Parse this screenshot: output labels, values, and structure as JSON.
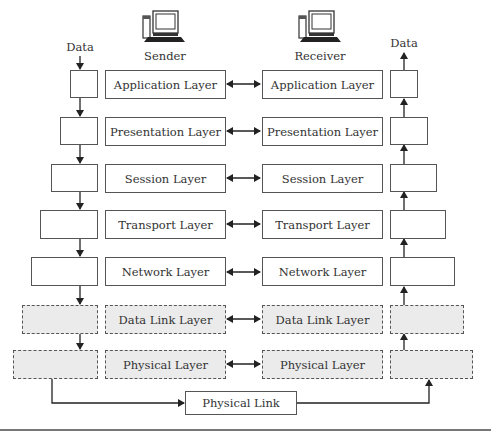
{
  "diagram": {
    "sender_label": "Sender",
    "receiver_label": "Receiver",
    "data_in_label": "Data",
    "data_out_label": "Data",
    "sender_icon": "computer-icon",
    "receiver_icon": "computer-icon",
    "layers": [
      {
        "name": "Application Layer",
        "style": "solid"
      },
      {
        "name": "Presentation Layer",
        "style": "solid"
      },
      {
        "name": "Session Layer",
        "style": "solid"
      },
      {
        "name": "Transport Layer",
        "style": "solid"
      },
      {
        "name": "Network Layer",
        "style": "solid"
      },
      {
        "name": "Data Link Layer",
        "style": "dashed-shaded"
      },
      {
        "name": "Physical Layer",
        "style": "dashed-shaded"
      }
    ],
    "physical_link_label": "Physical Link",
    "colors": {
      "line": "#333333",
      "border": "#555555",
      "shaded_fill": "#ebebeb"
    }
  }
}
